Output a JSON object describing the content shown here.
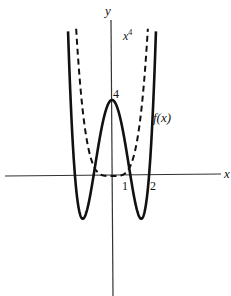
{
  "chart_data": {
    "type": "line",
    "title": "",
    "xlabel": "x",
    "ylabel": "y",
    "tick_labels": {
      "x": [
        "1",
        "2"
      ],
      "y": [
        "4"
      ]
    },
    "grid": false,
    "legend_position": "inline labels",
    "series": [
      {
        "name": "f(x)",
        "style": "solid",
        "formula": "x^4 - 5x^2 + 4",
        "points": [
          {
            "x": -2.3,
            "y": 5.53
          },
          {
            "x": -2,
            "y": 0
          },
          {
            "x": -1.58,
            "y": -2.25
          },
          {
            "x": -1,
            "y": 0
          },
          {
            "x": 0,
            "y": 4
          },
          {
            "x": 1,
            "y": 0
          },
          {
            "x": 1.58,
            "y": -2.25
          },
          {
            "x": 2,
            "y": 0
          },
          {
            "x": 2.3,
            "y": 5.53
          }
        ]
      },
      {
        "name": "x^4",
        "style": "dashed",
        "formula": "x^4",
        "points": [
          {
            "x": -1.95,
            "y": 14.5
          },
          {
            "x": -1,
            "y": 1
          },
          {
            "x": 0,
            "y": 0
          },
          {
            "x": 1,
            "y": 1
          },
          {
            "x": 1.95,
            "y": 14.5
          }
        ]
      }
    ],
    "annotations": [
      "4",
      "1",
      "2",
      "f(x)",
      "x^4"
    ]
  },
  "labels": {
    "x_axis": "x",
    "y_axis": "y",
    "tick_1": "1",
    "tick_2": "2",
    "peak": "4",
    "f_label": "f(x)",
    "x4_base": "x",
    "x4_exp": "4"
  }
}
